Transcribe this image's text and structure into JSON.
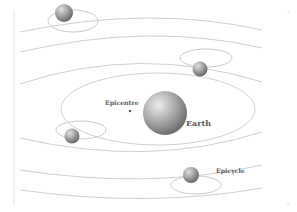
{
  "diagram": {
    "labels": {
      "center_body": "Earth",
      "center_point": "Epicentre",
      "small_circle": "Epicycle"
    },
    "planets": [
      {
        "name": "planet-top-left",
        "position": "top-left, partially cut off"
      },
      {
        "name": "planet-upper-right",
        "position": "upper-right"
      },
      {
        "name": "planet-left",
        "position": "left"
      },
      {
        "name": "planet-lower-right",
        "position": "lower-right, labeled epicycle"
      }
    ],
    "corner_marks": {
      "top_right": "2",
      "bottom_right": "3"
    },
    "colors": {
      "background": "#ffffff",
      "orbit_line": "#c9c9c9",
      "planet_light": "#e2e2e2",
      "planet_dark": "#7d7d7d",
      "label_text": "#5a5a5a"
    }
  }
}
